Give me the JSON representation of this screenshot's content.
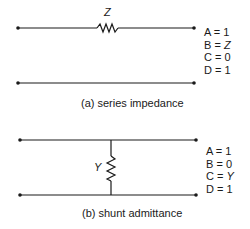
{
  "diagram_a": {
    "component_label": "Z",
    "abcd": [
      {
        "name": "A",
        "eq": "=",
        "value": "1",
        "italic": false
      },
      {
        "name": "B",
        "eq": "=",
        "value": "Z",
        "italic": true
      },
      {
        "name": "C",
        "eq": "=",
        "value": "0",
        "italic": false
      },
      {
        "name": "D",
        "eq": "=",
        "value": "1",
        "italic": false
      }
    ],
    "caption": "(a) series impedance"
  },
  "diagram_b": {
    "component_label": "Y",
    "abcd": [
      {
        "name": "A",
        "eq": "=",
        "value": "1",
        "italic": false
      },
      {
        "name": "B",
        "eq": "=",
        "value": "0",
        "italic": false
      },
      {
        "name": "C",
        "eq": "=",
        "value": "Y",
        "italic": true
      },
      {
        "name": "D",
        "eq": "=",
        "value": "1",
        "italic": false
      }
    ],
    "caption": "(b) shunt admittance"
  }
}
